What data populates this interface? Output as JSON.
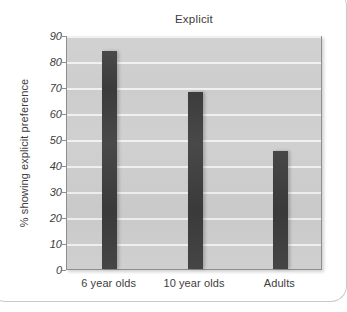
{
  "chart_data": {
    "type": "bar",
    "title": "Explicit",
    "xlabel": "",
    "ylabel": "% showing explicit preference",
    "categories": [
      "6 year olds",
      "10 year olds",
      "Adults"
    ],
    "values": [
      84,
      68,
      45.5
    ],
    "ylim": [
      0,
      90
    ],
    "ytick_labels": [
      "0",
      "10",
      "20",
      "30",
      "40",
      "50",
      "60",
      "70",
      "80",
      "90"
    ],
    "ytick_values": [
      0,
      10,
      20,
      30,
      40,
      50,
      60,
      70,
      80,
      90
    ],
    "grid": true,
    "legend": false,
    "bar_color": "#3b3b3b",
    "plot_background": "#cdcdcd",
    "gridline_color": "#f0f0f0"
  }
}
